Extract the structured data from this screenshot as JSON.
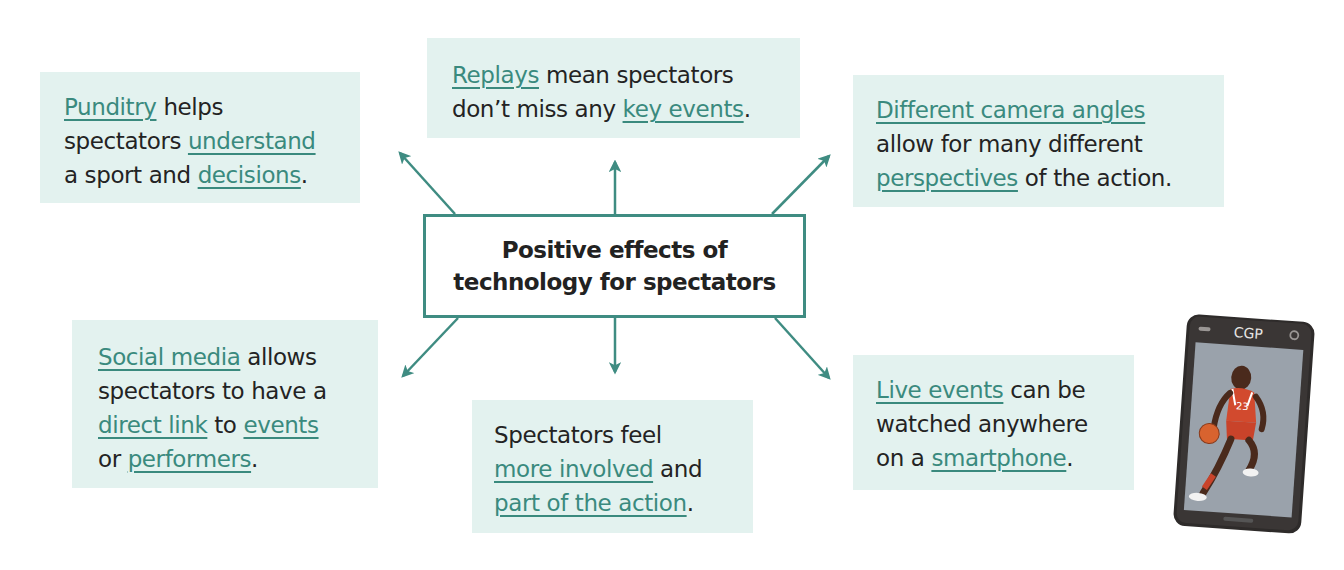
{
  "center": {
    "line1": "Positive effects of",
    "line2": "technology for spectators"
  },
  "colors": {
    "accent": "#3a8a7e",
    "arrow": "#3f8c82",
    "box_fill": "#e3f2ef",
    "text": "#232323"
  },
  "boxes": {
    "punditry": {
      "l1a": "Punditry",
      "l1b": " helps",
      "l2a": "spectators ",
      "l2b": "understand",
      "l3a": "a sport and ",
      "l3b": "decisions",
      "l3c": "."
    },
    "replays": {
      "l1a": "Replays",
      "l1b": " mean spectators",
      "l2a": "don’t miss any ",
      "l2b": "key events",
      "l2c": "."
    },
    "camera": {
      "l1a": "Different camera angles",
      "l2a": "allow for many different",
      "l3a": "perspectives",
      "l3b": " of the action."
    },
    "social": {
      "l1a": "Social media",
      "l1b": " allows",
      "l2a": "spectators to have a",
      "l3a": "direct link",
      "l3b": " to ",
      "l3c": "events",
      "l4a": "or ",
      "l4b": "performers",
      "l4c": "."
    },
    "involved": {
      "l1a": "Spectators feel",
      "l2a": "more involved",
      "l2b": " and",
      "l3a": "part of the action",
      "l3b": "."
    },
    "live": {
      "l1a": "Live events",
      "l1b": " can be",
      "l2a": "watched anywhere",
      "l3a": "on a ",
      "l3b": "smartphone",
      "l3c": "."
    }
  },
  "phone": {
    "brand": "CGP",
    "jersey_number": "23",
    "icon": "smartphone-basketball-player-illustration"
  }
}
